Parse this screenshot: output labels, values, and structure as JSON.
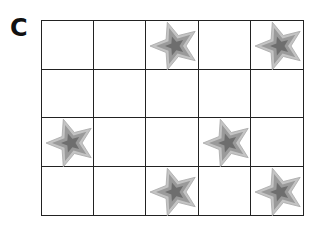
{
  "label": "C",
  "grid": {
    "rows": 4,
    "cols": 5,
    "stars": [
      [
        0,
        2
      ],
      [
        0,
        4
      ],
      [
        2,
        0
      ],
      [
        2,
        3
      ],
      [
        3,
        2
      ],
      [
        3,
        4
      ]
    ]
  },
  "colors": {
    "star_outer": "#c4c4c4",
    "star_mid": "#9a9a9a",
    "star_inner": "#6e6e6e",
    "grid_line": "#222222"
  }
}
